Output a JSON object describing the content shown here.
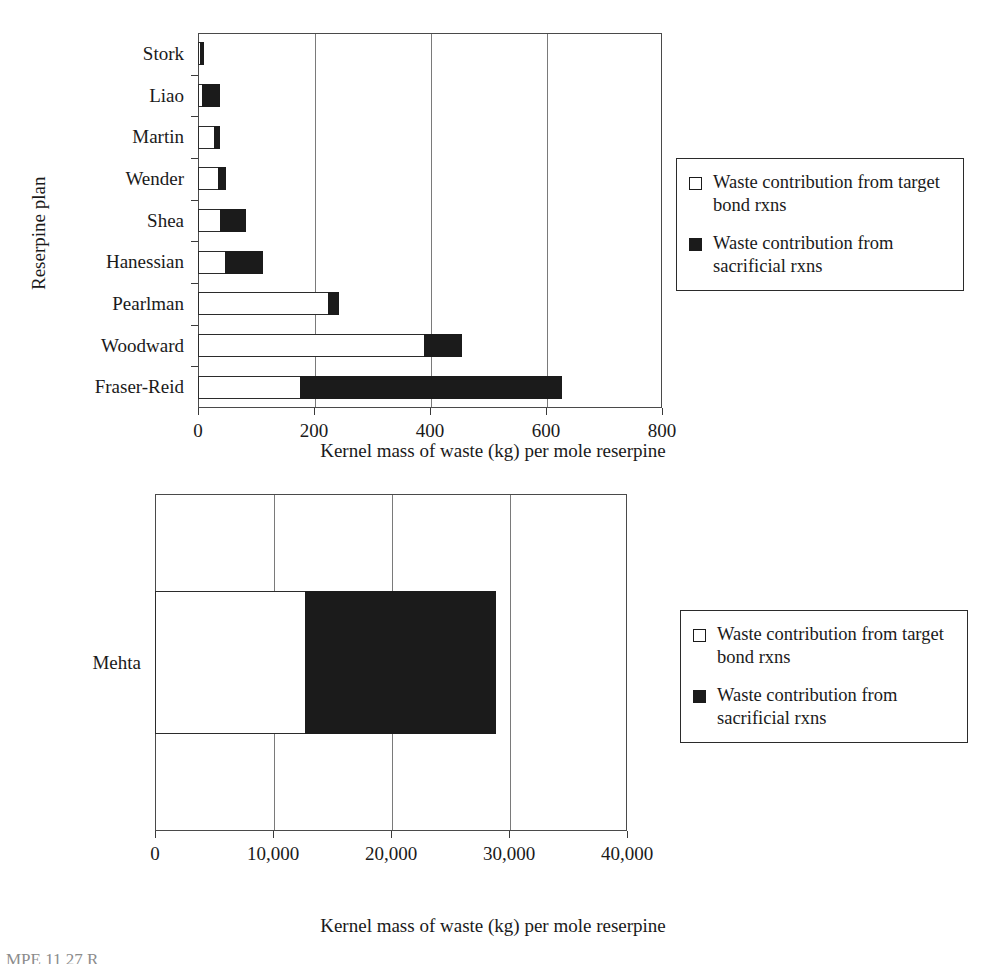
{
  "chart_data": [
    {
      "type": "bar",
      "orientation": "horizontal",
      "stacked": true,
      "title": "",
      "xlabel": "Kernel mass of waste (kg) per mole reserpine",
      "ylabel": "Reserpine plan",
      "xlim": [
        0,
        800
      ],
      "xticks": [
        0,
        200,
        400,
        600,
        800
      ],
      "xtick_labels": [
        "0",
        "200",
        "400",
        "600",
        "800"
      ],
      "grid": true,
      "grid_axis": "x",
      "legend_position": "right",
      "categories": [
        "Stork",
        "Liao",
        "Martin",
        "Wender",
        "Shea",
        "Hanessian",
        "Pearlman",
        "Woodward",
        "Fraser-Reid"
      ],
      "series": [
        {
          "name": "Waste contribution from target bond rxns",
          "color": "#ffffff",
          "edge_color": "#2b2b2b",
          "values": [
            5,
            8,
            30,
            36,
            40,
            48,
            225,
            392,
            178
          ]
        },
        {
          "name": "Waste contribution from sacrificial rxns",
          "color": "#1b1b1b",
          "edge_color": "#1b1b1b",
          "values": [
            7,
            32,
            10,
            14,
            45,
            65,
            20,
            65,
            452
          ]
        }
      ],
      "totals": [
        12,
        40,
        40,
        50,
        85,
        113,
        245,
        457,
        630
      ]
    },
    {
      "type": "bar",
      "orientation": "horizontal",
      "stacked": true,
      "title": "",
      "xlabel": "Kernel mass of waste (kg) per mole reserpine",
      "ylabel": "Reserpine plan",
      "xlim": [
        0,
        40000
      ],
      "xticks": [
        0,
        10000,
        20000,
        30000,
        40000
      ],
      "xtick_labels": [
        "0",
        "10,000",
        "20,000",
        "30,000",
        "40,000"
      ],
      "grid": true,
      "grid_axis": "x",
      "legend_position": "right",
      "categories": [
        "Mehta"
      ],
      "series": [
        {
          "name": "Waste contribution from target bond rxns",
          "color": "#ffffff",
          "edge_color": "#2b2b2b",
          "values": [
            12800
          ]
        },
        {
          "name": "Waste contribution from sacrificial rxns",
          "color": "#1b1b1b",
          "edge_color": "#1b1b1b",
          "values": [
            16200
          ]
        }
      ],
      "totals": [
        29000
      ]
    }
  ],
  "chart_top": {
    "axis_x_title": "Kernel mass of waste (kg) per mole reserpine",
    "axis_y_title": "Reserpine plan",
    "tick_labels": [
      "0",
      "200",
      "400",
      "600",
      "800"
    ],
    "categories": [
      {
        "label": "Stork"
      },
      {
        "label": "Liao"
      },
      {
        "label": "Martin"
      },
      {
        "label": "Wender"
      },
      {
        "label": "Shea"
      },
      {
        "label": "Hanessian"
      },
      {
        "label": "Pearlman"
      },
      {
        "label": "Woodward"
      },
      {
        "label": "Fraser-Reid"
      }
    ],
    "legend": {
      "entries": [
        {
          "label": "Waste contribution from target bond rxns",
          "style": "open"
        },
        {
          "label": "Waste contribution from sacrificial rxns",
          "style": "filled"
        }
      ]
    }
  },
  "chart_bottom": {
    "axis_x_title": "Kernel mass of waste (kg) per mole reserpine",
    "axis_y_title": "Reserpine plan",
    "tick_labels": [
      "0",
      "10,000",
      "20,000",
      "30,000",
      "40,000"
    ],
    "categories": [
      {
        "label": "Mehta"
      }
    ],
    "legend": {
      "entries": [
        {
          "label": "Waste contribution from target bond rxns",
          "style": "open"
        },
        {
          "label": "Waste contribution from sacrificial rxns",
          "style": "filled"
        }
      ]
    }
  },
  "bottom_caption": "MPE 11 27  R"
}
